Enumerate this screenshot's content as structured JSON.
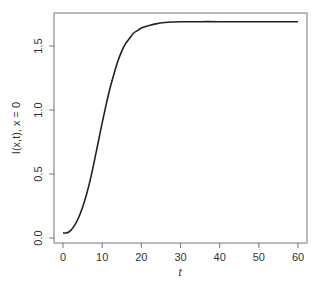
{
  "chart_data": {
    "type": "line",
    "title": "",
    "xlabel": "t",
    "ylabel": "I(x,t), x = 0",
    "xlim": [
      0,
      60
    ],
    "ylim": [
      0,
      1.69
    ],
    "xticks": [
      0,
      10,
      20,
      30,
      40,
      50,
      60
    ],
    "xtick_labels": [
      "0",
      "10",
      "20",
      "30",
      "40",
      "50",
      "60"
    ],
    "yticks": [
      0.0,
      0.5,
      1.0,
      1.5
    ],
    "ytick_labels": [
      "0.0",
      "0.5",
      "1.0",
      "1.5"
    ],
    "grid": false,
    "legend": "none",
    "series": [
      {
        "name": "I(0,t)",
        "color": "#222222",
        "x": [
          0,
          1,
          2,
          3,
          4,
          5,
          6,
          7,
          8,
          9,
          10,
          11,
          12,
          13,
          14,
          15,
          16,
          17,
          18,
          19,
          20,
          22,
          24,
          26,
          28,
          30,
          35,
          40,
          45,
          50,
          55,
          60
        ],
        "y": [
          0.04,
          0.04,
          0.06,
          0.1,
          0.16,
          0.24,
          0.34,
          0.46,
          0.6,
          0.75,
          0.9,
          1.04,
          1.17,
          1.28,
          1.38,
          1.46,
          1.52,
          1.56,
          1.6,
          1.62,
          1.64,
          1.66,
          1.675,
          1.683,
          1.687,
          1.689,
          1.69,
          1.69,
          1.69,
          1.69,
          1.69,
          1.69
        ]
      }
    ]
  }
}
